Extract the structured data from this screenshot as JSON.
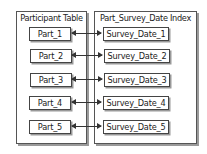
{
  "diagram": {
    "left_panel": {
      "title": "Participant Table",
      "items": [
        "Part_1",
        "Part_2",
        "Part_3",
        "Part_4",
        "Part_5"
      ]
    },
    "right_panel": {
      "title": "Part_Survey_Date Index",
      "items": [
        "Survey_Date_1",
        "Survey_Date_2",
        "Survey_Date_3",
        "Survey_Date_4",
        "Survey_Date_5"
      ]
    },
    "connections": "bidirectional arrows linking each Part_n to Survey_Date_n"
  }
}
